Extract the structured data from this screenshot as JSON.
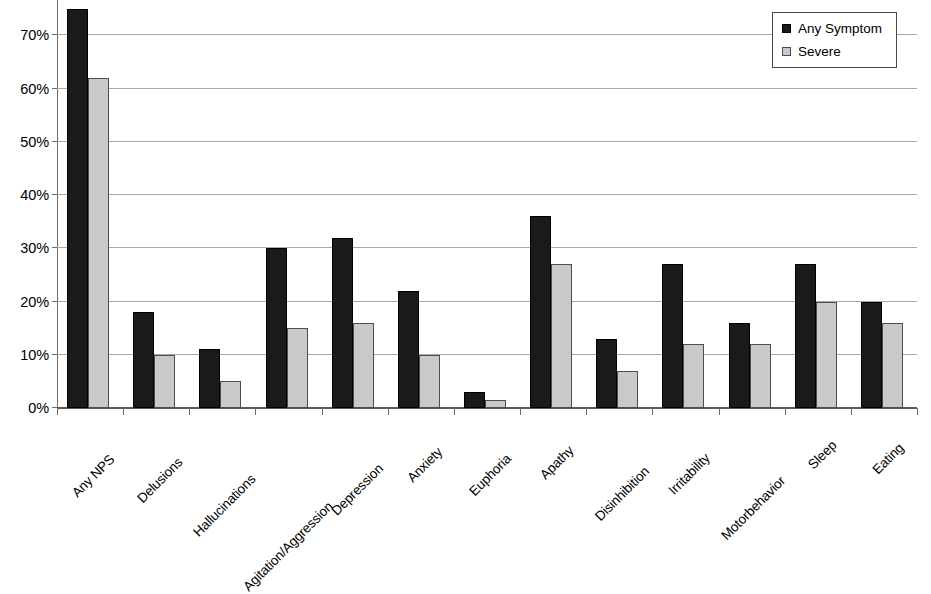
{
  "chart_data": {
    "type": "bar",
    "title": "",
    "subtitle": "",
    "xlabel": "",
    "ylabel": "",
    "ylim": [
      0,
      80
    ],
    "ytick_labels": [
      "0%",
      "10%",
      "20%",
      "30%",
      "40%",
      "50%",
      "60%",
      "70%",
      "80%"
    ],
    "ytick_values": [
      0,
      10,
      20,
      30,
      40,
      50,
      60,
      70,
      80
    ],
    "grid": true,
    "grid_axis": "y",
    "legend_position": "top-right",
    "x_label_rotation": -45,
    "categories": [
      "Any NPS",
      "Delusions",
      "Hallucinations",
      "Agitation/Aggression",
      "Depression",
      "Anxiety",
      "Euphoria",
      "Apathy",
      "Disinhibition",
      "Irritability",
      "Motorbehavior",
      "Sleep",
      "Eating"
    ],
    "series": [
      {
        "name": "Any Symptom",
        "color": "#1a1a1a",
        "values": [
          75,
          18,
          11,
          30,
          32,
          22,
          3,
          36,
          13,
          27,
          16,
          27,
          20
        ]
      },
      {
        "name": "Severe",
        "color": "#c9c9c9",
        "values": [
          62,
          10,
          5,
          15,
          16,
          10,
          1.5,
          27,
          7,
          12,
          12,
          20,
          16
        ]
      }
    ]
  },
  "legend": {
    "items": [
      {
        "label": "Any Symptom",
        "swatch": "dark-square-icon"
      },
      {
        "label": "Severe",
        "swatch": "light-square-icon"
      }
    ]
  }
}
